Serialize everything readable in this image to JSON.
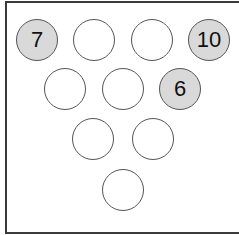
{
  "diagram": {
    "type": "bowling-pin-rack",
    "colors": {
      "standing_fill": "#d9d9d9",
      "empty_fill": "#ffffff",
      "outline": "#555555",
      "frame": "#3a3a3a"
    },
    "pins": [
      {
        "row": 1,
        "position": 1,
        "label": "7",
        "standing": true
      },
      {
        "row": 1,
        "position": 2,
        "label": "",
        "standing": false
      },
      {
        "row": 1,
        "position": 3,
        "label": "",
        "standing": false
      },
      {
        "row": 1,
        "position": 4,
        "label": "10",
        "standing": true
      },
      {
        "row": 2,
        "position": 1,
        "label": "",
        "standing": false
      },
      {
        "row": 2,
        "position": 2,
        "label": "",
        "standing": false
      },
      {
        "row": 2,
        "position": 3,
        "label": "6",
        "standing": true
      },
      {
        "row": 3,
        "position": 1,
        "label": "",
        "standing": false
      },
      {
        "row": 3,
        "position": 2,
        "label": "",
        "standing": false
      },
      {
        "row": 4,
        "position": 1,
        "label": "",
        "standing": false
      }
    ]
  }
}
